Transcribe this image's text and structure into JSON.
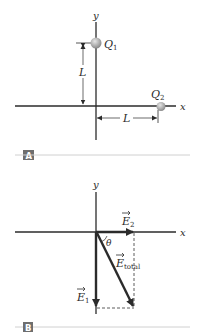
{
  "panel_a": {
    "tag": "A",
    "axis_x_label": "x",
    "axis_y_label": "y",
    "charge1": {
      "name": "Q",
      "subscript": "1"
    },
    "charge2": {
      "name": "Q",
      "subscript": "2"
    },
    "distance_vertical": "L",
    "distance_horizontal": "L"
  },
  "panel_b": {
    "tag": "B",
    "axis_x_label": "x",
    "axis_y_label": "y",
    "vector_e1": {
      "name": "E",
      "subscript": "1"
    },
    "vector_e2": {
      "name": "E",
      "subscript": "2"
    },
    "vector_total": {
      "name": "E",
      "subscript": "total"
    },
    "angle": "θ"
  },
  "colors": {
    "axis": "#2b2b2b",
    "charge": "#a8a8a8",
    "tag_bg": "#6e6e6e",
    "rule": "#d0d0d0",
    "dashed": "#333333"
  }
}
